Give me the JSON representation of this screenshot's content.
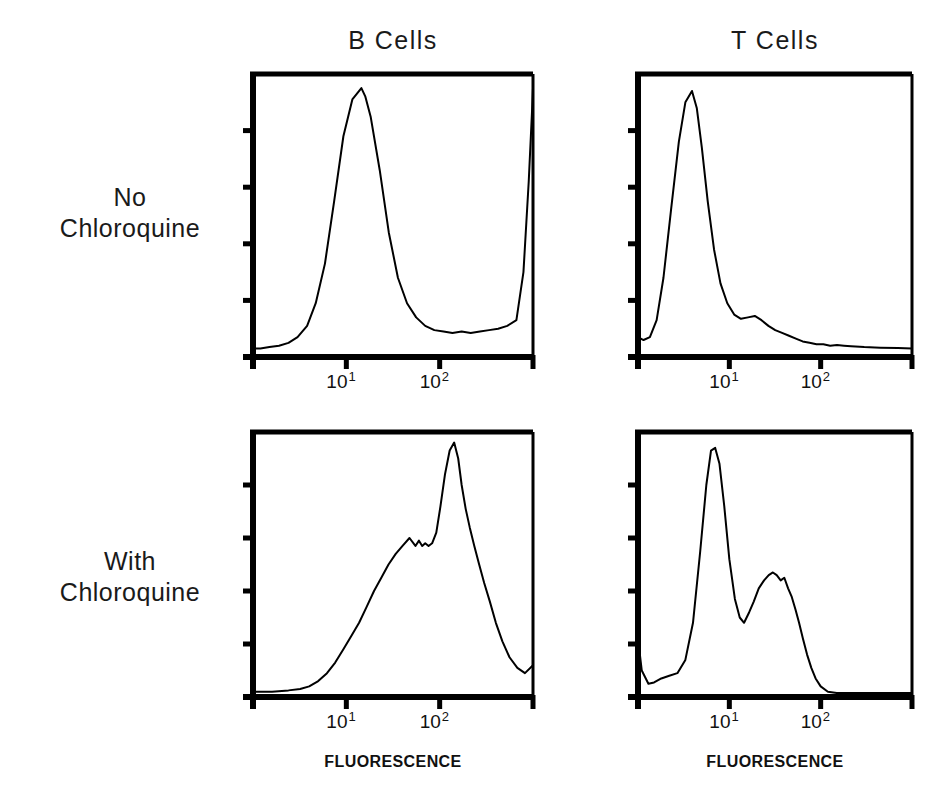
{
  "figure": {
    "column_titles": [
      "B Cells",
      "T Cells"
    ],
    "row_labels": [
      {
        "line1": "No",
        "line2": "Chloroquine"
      },
      {
        "line1": "With",
        "line2": "Chloroquine"
      }
    ],
    "axis_title": "FLUORESCENCE",
    "tick_labels": [
      {
        "base": "10",
        "exp": "1"
      },
      {
        "base": "10",
        "exp": "2"
      }
    ],
    "line_color": "#000000",
    "axis_color": "#000000"
  },
  "chart_data": [
    {
      "type": "line",
      "title": "B Cells — No Chloroquine",
      "row": "No Chloroquine",
      "column": "B Cells",
      "xlabel": "FLUORESCENCE",
      "ylabel": "Cell number",
      "xscale": "log",
      "xlim": [
        1,
        1000
      ],
      "ylim": [
        0,
        100
      ],
      "xticks": [
        10,
        100
      ],
      "xticklabels": [
        "10^1",
        "10^2"
      ],
      "yticks_unlabeled": 4,
      "description": "Broad single peak centred near 1.5x10^1 with a tall spike at the right edge of scale.",
      "x": [
        1.0,
        1.2,
        1.5,
        1.9,
        2.4,
        3.0,
        3.8,
        4.7,
        5.9,
        7.4,
        9.3,
        11.6,
        14.5,
        16.0,
        18.2,
        22.8,
        28.5,
        35.7,
        44.7,
        56.0,
        70.0,
        87.7,
        110.0,
        137.0,
        172.0,
        215.0,
        270.0,
        338.0,
        423.0,
        530.0,
        664.0,
        790.0,
        900.0,
        980.0,
        1000.0
      ],
      "y": [
        3,
        3,
        3.5,
        4,
        5,
        7,
        11,
        19,
        33,
        55,
        78,
        91,
        95,
        92,
        85,
        66,
        44,
        28,
        19,
        14,
        11,
        9.5,
        9,
        8.5,
        9,
        8.5,
        9,
        9.5,
        10,
        11,
        13,
        30,
        62,
        88,
        95
      ]
    },
    {
      "type": "line",
      "title": "T Cells — No Chloroquine",
      "row": "No Chloroquine",
      "column": "T Cells",
      "xlabel": "FLUORESCENCE",
      "ylabel": "Cell number",
      "xscale": "log",
      "xlim": [
        1,
        1000
      ],
      "ylim": [
        0,
        100
      ],
      "xticks": [
        10,
        100
      ],
      "xticklabels": [
        "10^1",
        "10^2"
      ],
      "yticks_unlabeled": 4,
      "description": "Sharp narrow peak near 4 with a long declining right tail and a small shoulder bump near 1.6x10^1.",
      "x": [
        1.0,
        1.15,
        1.35,
        1.6,
        1.9,
        2.3,
        2.8,
        3.3,
        3.9,
        4.4,
        5.0,
        5.8,
        6.8,
        8.0,
        9.5,
        11.3,
        13.4,
        16.0,
        19.0,
        22.5,
        26.8,
        31.8,
        37.8,
        45.0,
        53.5,
        63.5,
        75.5,
        90.0,
        107.0,
        127.0,
        151.0,
        180.0,
        215.0,
        300.0,
        450.0,
        700.0,
        1000.0
      ],
      "y": [
        7,
        6,
        7,
        13,
        28,
        52,
        76,
        90,
        94,
        88,
        74,
        55,
        38,
        26,
        19,
        15,
        13.5,
        14,
        14.5,
        13,
        11,
        9.5,
        8.5,
        7.5,
        6.5,
        5.5,
        5,
        4.5,
        4.5,
        4,
        4.2,
        4,
        3.8,
        3.5,
        3.3,
        3.2,
        3
      ]
    },
    {
      "type": "line",
      "title": "B Cells — With Chloroquine",
      "row": "With Chloroquine",
      "column": "B Cells",
      "xlabel": "FLUORESCENCE",
      "ylabel": "Cell number",
      "xscale": "log",
      "xlim": [
        1,
        1000
      ],
      "ylim": [
        0,
        100
      ],
      "xticks": [
        10,
        100
      ],
      "xticklabels": [
        "10^1",
        "10^2"
      ],
      "yticks_unlabeled": 4,
      "description": "Noisy gradual rise from baseline with a shoulder plateau near 6x10^1, then a tall sharp peak just above 1.4x10^2 falling steeply to the right edge.",
      "x": [
        1.0,
        1.6,
        2.4,
        3.2,
        4.0,
        5.0,
        6.2,
        7.6,
        9.3,
        11.3,
        13.7,
        16.5,
        19.8,
        23.7,
        28.3,
        33.8,
        40.0,
        47.5,
        55.0,
        60.0,
        65.0,
        70.0,
        76.0,
        83.0,
        92.0,
        102.0,
        114.0,
        128.0,
        143.0,
        158.0,
        172.0,
        190.0,
        210.0,
        235.0,
        265.0,
        300.0,
        345.0,
        400.0,
        470.0,
        560.0,
        680.0,
        820.0,
        1000.0
      ],
      "y": [
        2,
        2,
        2.5,
        3,
        4,
        6,
        9,
        13,
        18,
        23,
        28,
        34,
        40,
        45,
        50,
        54,
        57,
        60,
        57,
        59,
        57,
        58,
        57,
        58,
        62,
        72,
        84,
        93,
        96,
        90,
        80,
        71,
        64,
        57,
        50,
        43,
        36,
        28,
        21,
        15,
        11,
        9,
        12
      ]
    },
    {
      "type": "line",
      "title": "T Cells — With Chloroquine",
      "row": "With Chloroquine",
      "column": "T Cells",
      "xlabel": "FLUORESCENCE",
      "ylabel": "Cell number",
      "xscale": "log",
      "xlim": [
        1,
        1000
      ],
      "ylim": [
        0,
        100
      ],
      "xticks": [
        10,
        100
      ],
      "xticklabels": [
        "10^1",
        "10^2"
      ],
      "yticks_unlabeled": 4,
      "description": "Bimodal: tall sharp peak near 6 and a broad lower second peak near 3x10^1, returning to baseline before 10^2.",
      "x": [
        1.0,
        1.1,
        1.3,
        1.5,
        1.8,
        2.2,
        2.7,
        3.3,
        4.0,
        4.8,
        5.6,
        6.3,
        7.0,
        7.8,
        8.8,
        10.0,
        11.5,
        13.0,
        14.5,
        16.5,
        18.5,
        21.0,
        24.0,
        27.0,
        30.0,
        33.0,
        36.5,
        40.0,
        44.0,
        48.0,
        53.0,
        58.0,
        64.0,
        71.0,
        79.0,
        88.0,
        100.0,
        120.0,
        150.0,
        250.0,
        500.0,
        1000.0
      ],
      "y": [
        22,
        10,
        5,
        5.5,
        7,
        8,
        9,
        14,
        28,
        55,
        80,
        93,
        94,
        88,
        72,
        52,
        37,
        30,
        28,
        32,
        36,
        41,
        44,
        46,
        47,
        46,
        44,
        45,
        41,
        38,
        33,
        28,
        22,
        16,
        11,
        7,
        4,
        2,
        1.5,
        1.5,
        1.5,
        1.5
      ]
    }
  ]
}
